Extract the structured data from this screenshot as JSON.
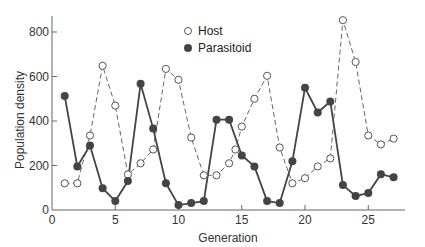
{
  "chart_data": {
    "type": "line",
    "title": "",
    "xlabel": "Generation",
    "ylabel": "Population density",
    "xlim": [
      0,
      28
    ],
    "ylim": [
      0,
      870
    ],
    "xticks": [
      0,
      5,
      10,
      15,
      20,
      25
    ],
    "yticks": [
      0,
      200,
      400,
      600,
      800
    ],
    "grid": false,
    "legend_position": "top-center",
    "series": [
      {
        "name": "Host",
        "marker": "open-circle",
        "line_style": "dashed",
        "color": "#555555",
        "x": [
          1,
          2,
          3,
          4,
          5,
          6,
          7,
          8,
          9,
          10,
          11,
          12,
          13,
          14,
          14.5,
          15,
          16,
          17,
          18,
          19,
          20,
          21,
          22,
          23,
          24,
          25,
          26,
          27
        ],
        "values": [
          120,
          120,
          335,
          648,
          469,
          160,
          210,
          272,
          634,
          585,
          326,
          156,
          156,
          210,
          272,
          375,
          500,
          603,
          281,
          120,
          143,
          196,
          232,
          853,
          665,
          335,
          295,
          321
        ]
      },
      {
        "name": "Parasitoid",
        "marker": "filled-circle",
        "line_style": "solid",
        "color": "#444444",
        "x": [
          1,
          2,
          3,
          4,
          5,
          6,
          7,
          8,
          9,
          10,
          11,
          12,
          13,
          14,
          15,
          16,
          17,
          18,
          19,
          20,
          21,
          22,
          23,
          24,
          25,
          26,
          27
        ],
        "values": [
          513,
          196,
          290,
          98,
          40,
          130,
          567,
          366,
          120,
          22,
          31,
          40,
          406,
          406,
          245,
          196,
          40,
          31,
          219,
          549,
          438,
          487,
          112,
          63,
          76,
          161,
          147
        ]
      }
    ]
  }
}
